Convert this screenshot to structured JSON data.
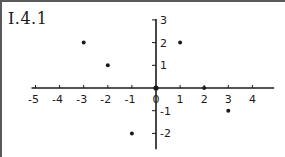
{
  "figure": {
    "label": "I.4.1"
  },
  "chart_data": {
    "type": "scatter",
    "title": "I.4.1",
    "xlabel": "",
    "ylabel": "",
    "xlim": [
      -5,
      4.9
    ],
    "ylim": [
      -2.7,
      3
    ],
    "grid": false,
    "legend": null,
    "x_ticks": [
      -5,
      -4,
      -3,
      -2,
      -1,
      0,
      1,
      2,
      3,
      4
    ],
    "x_tick_labels": [
      "-5",
      "-4",
      "-3",
      "-2",
      "-1",
      "0",
      "1",
      "2",
      "3",
      "4"
    ],
    "y_ticks": [
      3,
      2,
      1,
      -1,
      -2
    ],
    "y_tick_labels": [
      "3",
      "2",
      "1",
      "-1",
      "-2"
    ],
    "series": [
      {
        "name": "points",
        "points": [
          {
            "x": -3,
            "y": 2
          },
          {
            "x": -2,
            "y": 1
          },
          {
            "x": 0,
            "y": 0
          },
          {
            "x": 1,
            "y": 2
          },
          {
            "x": 2,
            "y": 0
          },
          {
            "x": 3,
            "y": -1
          },
          {
            "x": -1,
            "y": -2
          }
        ]
      }
    ]
  },
  "colors": {
    "ink": "#1a1a1a",
    "frame": "#5a5a5a",
    "background": "#ffffff"
  }
}
